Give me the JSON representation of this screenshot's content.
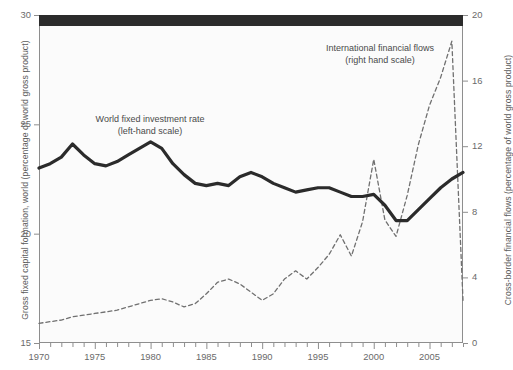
{
  "chart_data": {
    "type": "line",
    "title": "",
    "xlabel": "",
    "x": [
      1970,
      1971,
      1972,
      1973,
      1974,
      1975,
      1976,
      1977,
      1978,
      1979,
      1980,
      1981,
      1982,
      1983,
      1984,
      1985,
      1986,
      1987,
      1988,
      1989,
      1990,
      1991,
      1992,
      1993,
      1994,
      1995,
      1996,
      1997,
      1998,
      1999,
      2000,
      2001,
      2002,
      2003,
      2004,
      2005,
      2006,
      2007,
      2008
    ],
    "xlim": [
      1970,
      2008
    ],
    "xticks_major": [
      1970,
      1975,
      1980,
      1985,
      1990,
      1995,
      2000,
      2005
    ],
    "xtick_minor_step": 1,
    "grid": false,
    "legend_position": "inline-annotations",
    "axes": [
      {
        "id": "left",
        "label": "Gross fixed capital formation, world (percentage of world gross product)",
        "ticks": [
          15,
          20,
          25,
          30
        ],
        "lim": [
          15,
          30
        ]
      },
      {
        "id": "right",
        "label": "Cross-border financial flows (percentage of world gross product)",
        "ticks": [
          0,
          4,
          8,
          12,
          16,
          20
        ],
        "lim": [
          0,
          20
        ]
      }
    ],
    "series": [
      {
        "name": "World fixed investment rate",
        "axis": "left",
        "style": "solid",
        "color": "#2b2b2b",
        "width": 3.2,
        "annotation": "World fixed investment rate\n(left-hand scale)",
        "values": [
          23.0,
          23.2,
          23.5,
          24.1,
          23.6,
          23.2,
          23.1,
          23.3,
          23.6,
          23.9,
          24.2,
          23.9,
          23.2,
          22.7,
          22.3,
          22.2,
          22.3,
          22.2,
          22.6,
          22.8,
          22.6,
          22.3,
          22.1,
          21.9,
          22.0,
          22.1,
          22.1,
          21.9,
          21.7,
          21.7,
          21.8,
          21.3,
          20.6,
          20.6,
          21.1,
          21.6,
          22.1,
          22.5,
          22.8
        ]
      },
      {
        "name": "International financial flows",
        "axis": "right",
        "style": "dashed",
        "color": "#707070",
        "width": 1.3,
        "annotation": "International financial flows\n(right hand scale)",
        "values": [
          1.2,
          1.3,
          1.4,
          1.6,
          1.7,
          1.8,
          1.9,
          2.0,
          2.2,
          2.4,
          2.6,
          2.7,
          2.5,
          2.2,
          2.4,
          3.0,
          3.7,
          3.9,
          3.6,
          3.1,
          2.6,
          3.0,
          3.9,
          4.4,
          3.9,
          4.6,
          5.4,
          6.6,
          5.3,
          7.4,
          11.2,
          7.5,
          6.5,
          9.0,
          12.1,
          14.5,
          16.2,
          18.4,
          2.6
        ]
      }
    ]
  },
  "annotations": {
    "investment": {
      "line1": "World fixed investment rate",
      "line2": "(left-hand scale)"
    },
    "flows": {
      "line1": "International financial flows",
      "line2": "(right hand scale)"
    }
  },
  "axis_titles": {
    "left": "Gross fixed capital formation, world (percentage of world gross product)",
    "right": "Cross-border financial flows (percentage of world gross product)"
  },
  "tick_labels": {
    "left": [
      "30",
      "25",
      "20",
      "15"
    ],
    "right": [
      "20",
      "16",
      "12",
      "8",
      "4",
      "0"
    ],
    "bottom": [
      "1970",
      "1975",
      "1980",
      "1985",
      "1990",
      "1995",
      "2000",
      "2005"
    ]
  },
  "colors": {
    "band": "#2b2b2b",
    "solid_series": "#2b2b2b",
    "dashed_series": "#707070",
    "frame": "#8e8e8e",
    "plot_background": "#fbfbfb",
    "tick_text": "#6a6a6a",
    "axis_title_text": "#5c5c5c"
  }
}
